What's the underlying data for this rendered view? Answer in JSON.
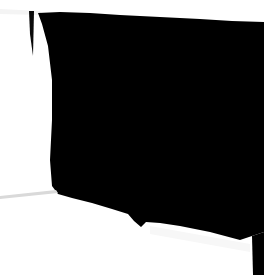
{
  "image": {
    "kind": "scanned-document-silhouette",
    "width": 264,
    "height": 275,
    "alt_text": "High contrast scan: large black irregular region on white page background",
    "background_color": "#ffffff",
    "foreground_color": "#000000",
    "paper_tint_color": "#fdfdfd",
    "faint_edge_color": "#e8e8e8",
    "soft_shadow_color": "#f2f2f2"
  },
  "regions": {
    "page_background": {
      "name": "page-background",
      "color": "#ffffff"
    },
    "main_black_mass": {
      "name": "main-black-mass",
      "color": "#000000",
      "description": "Dominant dark region occupying center, top and right of the frame",
      "outline_points": "38,13 60,12 90,13 120,15 160,17 200,19 232,21 264,22 264,232 252,236 240,240 210,232 180,226 160,223 146,222 141,227 134,221 128,214 112,209 92,203 72,198 58,194 52,186 50,160 52,120 52,80 48,46 42,24",
      "top_edge_note": "Top boundary dips to y≈15 near x=120 then rises to y≈22 at right edge",
      "bottom_notch_note": "V shaped notch point near x=140, y=227"
    },
    "left_sliver": {
      "name": "left-dark-sliver",
      "color": "#0a0a0a",
      "description": "Thin tapering dark wedge detached at upper left",
      "outline_points": "29,11 34,11 33,56 30,34"
    },
    "top_left_tint": {
      "name": "top-left-paper-tint",
      "color": "#f4f4f4",
      "description": "Faint grey diagonal band across the top left corner",
      "outline_points": "0,9 40,11 42,15 0,14"
    },
    "lower_left_crease": {
      "name": "lower-left-crease-line",
      "color": "#d9d9d9",
      "description": "Thin grey diagonal crease crossing the white area at lower left",
      "outline_points": "0,196 56,190 58,193 0,199"
    },
    "right_edge_strip": {
      "name": "right-edge-dark-strip",
      "color": "#000000",
      "description": "Narrow black strip hugging the far right edge down to the bottom",
      "outline_points": "252,236 264,232 264,275 253,275"
    },
    "bottom_shadow": {
      "name": "bottom-soft-shadow",
      "color": "#f7f7f7",
      "description": "Very light shading just under the main mass at bottom right",
      "outline_points": "150,226 250,244 250,252 150,234"
    }
  },
  "labels": {
    "title": "",
    "caption": ""
  }
}
